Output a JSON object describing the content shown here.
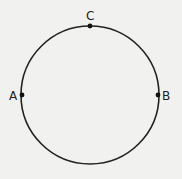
{
  "diagram": {
    "type": "circle-with-points",
    "background": "#f1f1f0",
    "stroke_color": "#222222",
    "circle": {
      "cx": 90,
      "cy": 95,
      "r": 69
    },
    "points": [
      {
        "label": "C",
        "x": 90,
        "y": 26,
        "label_x": 86,
        "label_y": 20
      },
      {
        "label": "A",
        "x": 22,
        "y": 95,
        "label_x": 9,
        "label_y": 100
      },
      {
        "label": "B",
        "x": 158,
        "y": 95,
        "label_x": 162,
        "label_y": 100
      }
    ]
  }
}
